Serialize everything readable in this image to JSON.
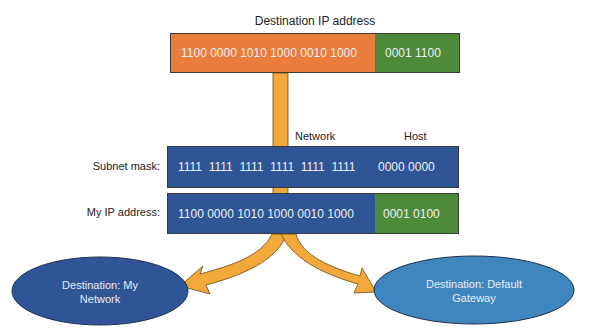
{
  "destination_ip": {
    "title": "Destination IP address",
    "network_bits": "1100 0000 1010 1000 0010 1000",
    "host_bits": "0001 1100"
  },
  "column_labels": {
    "network": "Network",
    "host": "Host"
  },
  "subnet_mask": {
    "label": "Subnet mask:",
    "network_bits": "1111  1111  1111  1111  1111  1111",
    "host_bits": "0000 0000"
  },
  "my_ip": {
    "label": "My IP address:",
    "network_bits": "1100 0000 1010 1000 0010 1000",
    "host_bits": "0001 0100"
  },
  "outcomes": {
    "left": "Destination: My Network",
    "right": "Destination: Default Gateway"
  },
  "colors": {
    "network_orange": "#ea7d3e",
    "host_green": "#4d8a3a",
    "mask_blue": "#2f5597",
    "arrow_gold": "#f2a83a",
    "ellipse_dark_blue": "#2f5597",
    "ellipse_light_blue": "#3f86bf"
  }
}
